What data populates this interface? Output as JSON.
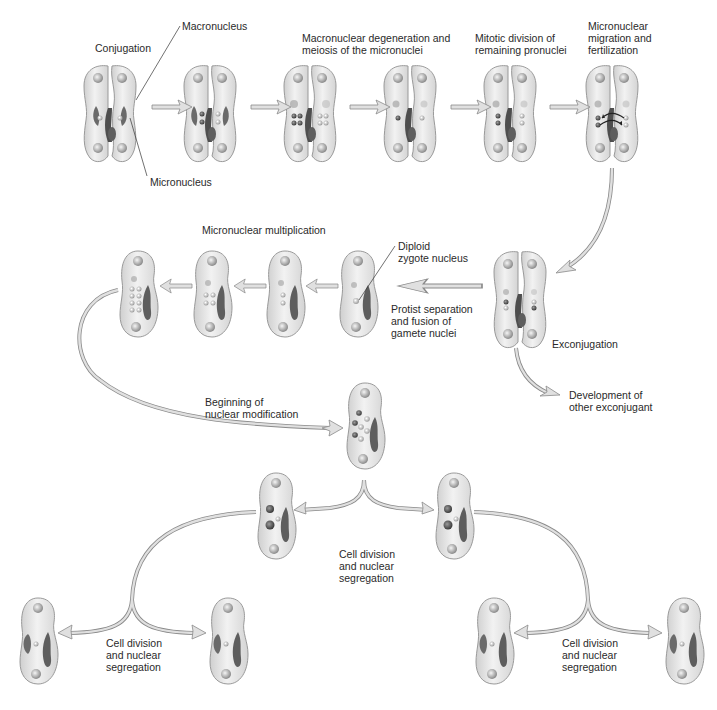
{
  "labels": {
    "conjugation": "Conjugation",
    "macronucleus": "Macronucleus",
    "micronucleus": "Micronucleus",
    "macronuclear_degeneration": "Macronuclear degeneration and\nmeiosis of the micronuclei",
    "mitotic_division": "Mitotic division of\nremaining pronuclei",
    "micronuclear_migration": "Micronuclear\nmigration and\nfertilization",
    "micronuclear_multiplication": "Micronuclear multiplication",
    "diploid_zygote": "Diploid\nzygote nucleus",
    "protist_separation": "Protist separation\nand fusion of\ngamete nuclei",
    "exconjugation": "Exconjugation",
    "development_other": "Development of\nother exconjugant",
    "beginning_modification": "Beginning of\nnuclear modification",
    "cell_division_center": "Cell division\nand nuclear\nsegregation",
    "cell_division_left": "Cell division\nand nuclear\nsegregation",
    "cell_division_right": "Cell division\nand nuclear\nsegregation"
  },
  "colors": {
    "cell_fill": "#e4e4e4",
    "cell_stroke": "#9a9a9a",
    "nucleus_dark": "#5a5a5a",
    "arrow_fill": "#dcdcdc",
    "arrow_stroke": "#8a8a8a",
    "text": "#2a2a2a"
  }
}
